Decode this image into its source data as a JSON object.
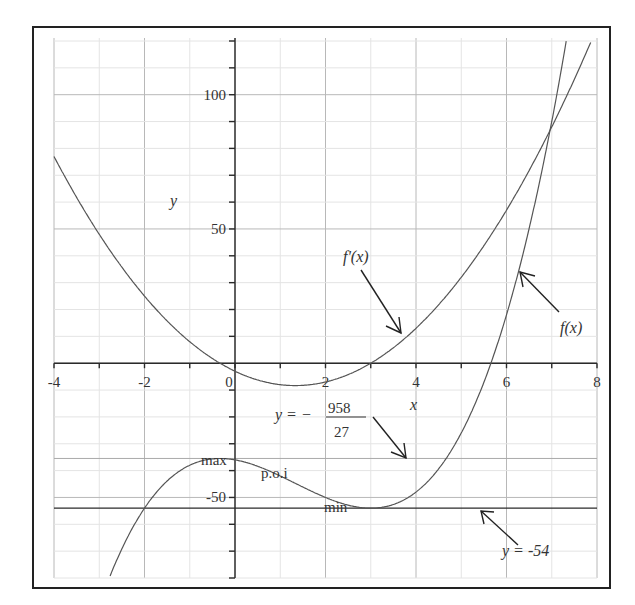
{
  "chart_data": {
    "type": "line",
    "title": "",
    "xlabel": "x",
    "ylabel": "y",
    "xlim": [
      -4,
      8
    ],
    "ylim": [
      -80,
      120
    ],
    "grid": true,
    "x_ticks": [
      -4,
      -2,
      0,
      2,
      4,
      6,
      8
    ],
    "x_tick_labels": [
      "-4",
      "-2",
      "0",
      "2",
      "4",
      "6",
      "8"
    ],
    "y_ticks": [
      -50,
      50,
      100
    ],
    "y_tick_labels": [
      "-50",
      "50",
      "100"
    ],
    "series": [
      {
        "name": "f(x)",
        "expression": "x^3 - 4x^2 - 3x - 36",
        "coefficients": [
          1,
          -4,
          -3,
          -36
        ],
        "x": [
          -2.8,
          -2,
          -1,
          -0.333,
          0,
          1,
          1.333,
          2,
          3,
          4,
          5,
          6,
          7,
          7.25
        ],
        "values": [
          -72.5,
          -54,
          -38,
          -35.48,
          -36,
          -42,
          -42.52,
          -48,
          -54,
          -48,
          -26,
          18,
          90,
          105.6
        ]
      },
      {
        "name": "f'(x)",
        "expression": "3x^2 - 8x - 3",
        "coefficients": [
          3,
          -8,
          -3
        ],
        "x": [
          -4,
          -3,
          -2,
          -1,
          -0.333,
          0,
          1,
          1.333,
          2,
          3,
          4,
          5,
          6,
          7,
          8
        ],
        "values": [
          77,
          48,
          25,
          8,
          0,
          -3,
          -8,
          -8.33,
          -7,
          0,
          13,
          32,
          57,
          88,
          125
        ]
      }
    ],
    "reference_lines": [
      {
        "name": "y = -958/27",
        "y": -35.48
      },
      {
        "name": "y = -54",
        "y": -54
      }
    ],
    "annotations": [
      {
        "text": "max",
        "x": -0.333,
        "y": -35.48
      },
      {
        "text": "p.o.i",
        "x": 1.333,
        "y": -42.52
      },
      {
        "text": "min",
        "x": 3,
        "y": -54
      },
      {
        "text": "f'(x)",
        "arrow_to": [
          3.7,
          10
        ]
      },
      {
        "text": "f(x)",
        "arrow_to": [
          6.3,
          35
        ]
      },
      {
        "text": "y = -958/27",
        "arrow_to": [
          3.8,
          -36
        ]
      },
      {
        "text": "y = -54",
        "arrow_to": [
          5.4,
          -54
        ]
      }
    ]
  },
  "labels": {
    "y_axis": "y",
    "x_axis": "x",
    "fprime": "f'(x)",
    "f": "f(x)",
    "max": "max",
    "poi": "p.o.i",
    "min": "min",
    "eq_prefix": "y = −",
    "frac_num": "958",
    "frac_den": "27",
    "y54": "y = -54"
  }
}
